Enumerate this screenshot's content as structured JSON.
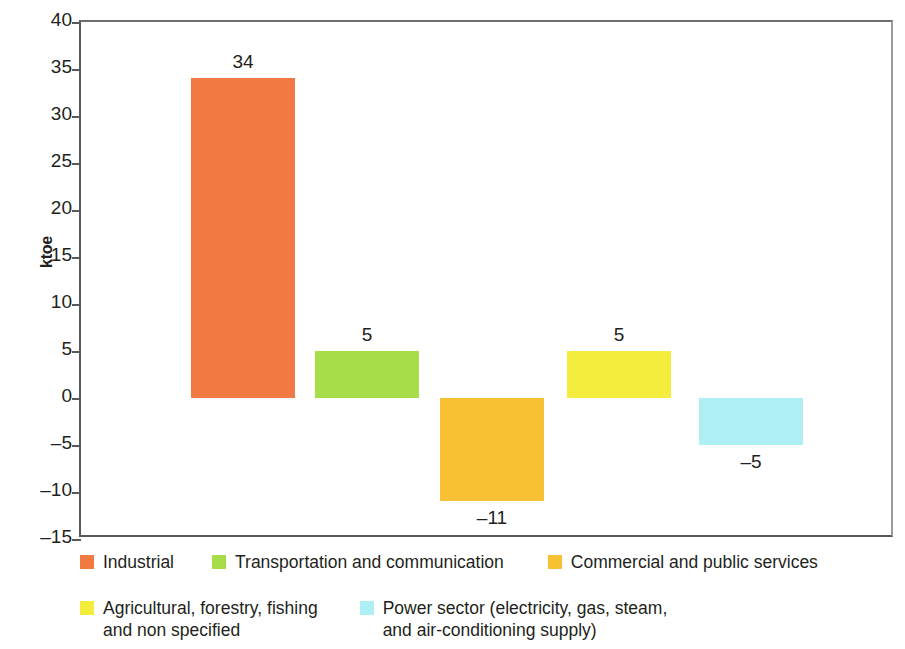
{
  "chart_data": {
    "type": "bar",
    "title": "",
    "subtitle": "",
    "xlabel": "",
    "ylabel": "ktoe",
    "ylim": [
      -15,
      40
    ],
    "yticks": [
      40,
      35,
      30,
      25,
      20,
      15,
      10,
      5,
      0,
      -5,
      -10,
      -15
    ],
    "ytick_labels": [
      "40",
      "35",
      "30",
      "25",
      "20",
      "15",
      "10",
      "5",
      "0",
      "–5",
      "–10",
      "–15"
    ],
    "grid": false,
    "legend_position": "bottom",
    "categories": [
      "Industrial",
      "Transportation and communication",
      "Commercial and public services",
      "Agricultural, forestry, fishing and non specified",
      "Power sector (electricity, gas, steam, and air-conditioning supply)"
    ],
    "values": [
      34,
      5,
      -11,
      5,
      -5
    ],
    "value_labels": [
      "34",
      "5",
      "–11",
      "5",
      "–5"
    ],
    "colors": [
      "#F07A42",
      "#A8DD4A",
      "#F8C133",
      "#F5ED3D",
      "#AEEEF5"
    ]
  },
  "legend": {
    "rows": [
      [
        {
          "label": "Industrial",
          "color": "#F07A42"
        },
        {
          "label": "Transportation and communication",
          "color": "#A8DD4A"
        },
        {
          "label": "Commercial and public services",
          "color": "#F8C133"
        }
      ],
      [
        {
          "label": "Agricultural, forestry, fishing\nand non specified",
          "color": "#F5ED3D"
        },
        {
          "label": "Power sector (electricity, gas, steam,\nand air-conditioning supply)",
          "color": "#AEEEF5"
        }
      ]
    ]
  },
  "axis": {
    "y_title": "ktoe"
  }
}
